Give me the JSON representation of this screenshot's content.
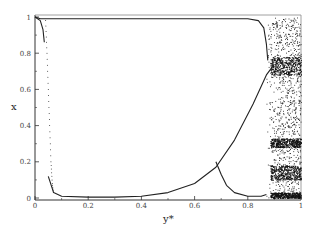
{
  "chart_data": {
    "type": "scatter",
    "title": "",
    "xlabel": "y*",
    "ylabel": "x",
    "xlim": [
      0,
      1
    ],
    "ylim": [
      0,
      1
    ],
    "grid": false,
    "legend": null,
    "x_ticks": [
      "0",
      "0.2",
      "0.4",
      "0.6",
      "0.8",
      "1"
    ],
    "y_ticks": [
      "0",
      "0.2",
      "0.4",
      "0.6",
      "0.8",
      "1"
    ],
    "series": [
      {
        "name": "upper-stable-branch",
        "style": "line",
        "x": [
          0.0,
          0.02,
          0.04,
          0.8,
          0.84,
          0.86,
          0.87,
          0.875
        ],
        "y": [
          1.0,
          0.99,
          0.99,
          0.99,
          0.98,
          0.94,
          0.85,
          0.76
        ]
      },
      {
        "name": "upper-left-drop",
        "style": "line",
        "x": [
          0.0,
          0.02,
          0.03,
          0.035
        ],
        "y": [
          1.0,
          0.98,
          0.93,
          0.86
        ]
      },
      {
        "name": "dotted-transition-left",
        "style": "dots",
        "x": [
          0.04,
          0.045,
          0.05,
          0.055,
          0.06,
          0.065,
          0.07
        ],
        "y": [
          0.98,
          0.8,
          0.6,
          0.4,
          0.2,
          0.08,
          0.02
        ]
      },
      {
        "name": "lower-branch-rising",
        "style": "line",
        "x": [
          0.05,
          0.07,
          0.1,
          0.2,
          0.3,
          0.4,
          0.5,
          0.6,
          0.68,
          0.75,
          0.82,
          0.87,
          0.9
        ],
        "y": [
          0.12,
          0.03,
          0.01,
          0.005,
          0.005,
          0.01,
          0.03,
          0.08,
          0.17,
          0.32,
          0.52,
          0.68,
          0.74
        ]
      },
      {
        "name": "lower-branch-falling",
        "style": "line",
        "x": [
          0.68,
          0.7,
          0.72,
          0.75,
          0.8,
          0.85,
          0.87
        ],
        "y": [
          0.2,
          0.13,
          0.07,
          0.03,
          0.01,
          0.01,
          0.02
        ]
      },
      {
        "name": "chaotic-region",
        "style": "scatter-dense",
        "x_range": [
          0.87,
          1.0
        ],
        "y_range": [
          0.0,
          1.0
        ],
        "dense_bands_y": [
          [
            0.68,
            0.78
          ],
          [
            0.28,
            0.33
          ],
          [
            0.1,
            0.18
          ],
          [
            0.0,
            0.03
          ]
        ]
      }
    ]
  }
}
